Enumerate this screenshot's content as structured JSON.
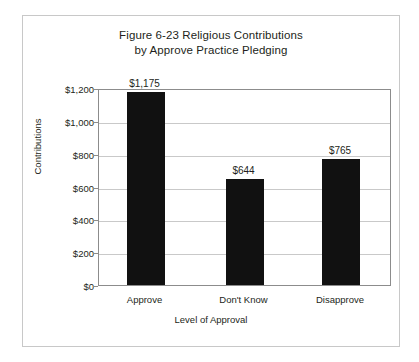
{
  "chart_data": {
    "type": "bar",
    "title": "Figure 6-23 Religious Contributions by Approve Practice Pledging",
    "title_line1": "Figure 6-23 Religious Contributions",
    "title_line2": "by Approve Practice Pledging",
    "xlabel": "Level of Approval",
    "ylabel": "Contributions",
    "categories": [
      "Approve",
      "Don't Know",
      "Disapprove"
    ],
    "values": [
      1175,
      644,
      765
    ],
    "value_labels": [
      "$1,175",
      "$644",
      "$765"
    ],
    "ylim": [
      0,
      1200
    ],
    "ytick_values": [
      0,
      200,
      400,
      600,
      800,
      1000,
      1200
    ],
    "ytick_labels": [
      "$0",
      "$200",
      "$400",
      "$600",
      "$800",
      "$1,000",
      "$1,200"
    ],
    "grid": true,
    "legend": false,
    "bar_color": "#111111",
    "gridline_color": "#c9c9c9",
    "axis_color": "#8c8c8c",
    "background_color": "#ffffff"
  }
}
